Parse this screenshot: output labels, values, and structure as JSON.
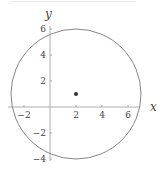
{
  "figure": {
    "axis_labels": {
      "x": "x",
      "y": "y"
    },
    "x_ticks": [
      {
        "value": -2,
        "label": "−2"
      },
      {
        "value": 2,
        "label": "2"
      },
      {
        "value": 4,
        "label": "4"
      },
      {
        "value": 6,
        "label": "6"
      }
    ],
    "y_ticks": [
      {
        "value": 6,
        "label": "6"
      },
      {
        "value": 4,
        "label": "4"
      },
      {
        "value": 2,
        "label": "2"
      },
      {
        "value": -2,
        "label": "−2"
      },
      {
        "value": -4,
        "label": "−4"
      }
    ],
    "circle": {
      "center": [
        2,
        1
      ],
      "radius": 5
    },
    "point": {
      "x": 2,
      "y": 1
    },
    "colors": {
      "curve": "#777777",
      "axis": "#999999",
      "point": "#333333",
      "text": "#444444"
    }
  }
}
